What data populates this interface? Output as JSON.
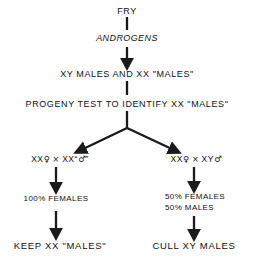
{
  "diagram": {
    "title_node": "FRY",
    "hormone_node": "ANDROGENS",
    "population_node": "XY MALES AND XX \"MALES\"",
    "test_node": "PROGENY TEST TO IDENTIFY XX \"MALES\"",
    "left_branch": {
      "cross_female": "XX",
      "female_symbol": "♀",
      "cross_operator": "×",
      "cross_male": "XX",
      "male_symbol": "♂",
      "male_open_quote": "“",
      "male_close_quote": "”",
      "result": "100% FEMALES",
      "outcome": "KEEP XX \"MALES\""
    },
    "right_branch": {
      "cross_female": "XX",
      "female_symbol": "♀",
      "cross_operator": "×",
      "cross_male": "XY",
      "male_symbol": "♂",
      "result_line1": "50% FEMALES",
      "result_line2": "50% MALES",
      "outcome": "CULL XY MALES"
    },
    "colors": {
      "background": "#ffffff",
      "text": "#111111",
      "arrow": "#1a1a1a"
    }
  }
}
